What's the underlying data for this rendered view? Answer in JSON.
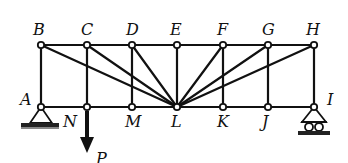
{
  "diagram": {
    "type": "truss",
    "colors": {
      "line": "#111111",
      "node_fill": "#ffffff",
      "background": "#ffffff"
    },
    "top_nodes": [
      {
        "id": "B",
        "label": "B",
        "x": 41,
        "y": 45
      },
      {
        "id": "C",
        "label": "C",
        "x": 87,
        "y": 45
      },
      {
        "id": "D",
        "label": "D",
        "x": 132,
        "y": 45
      },
      {
        "id": "E",
        "label": "E",
        "x": 177,
        "y": 45
      },
      {
        "id": "F",
        "label": "F",
        "x": 223,
        "y": 45
      },
      {
        "id": "G",
        "label": "G",
        "x": 268,
        "y": 45
      },
      {
        "id": "H",
        "label": "H",
        "x": 314,
        "y": 45
      }
    ],
    "bottom_nodes": [
      {
        "id": "A",
        "label": "A",
        "x": 41,
        "y": 107
      },
      {
        "id": "N",
        "label": "N",
        "x": 87,
        "y": 107
      },
      {
        "id": "M",
        "label": "M",
        "x": 132,
        "y": 107
      },
      {
        "id": "L",
        "label": "L",
        "x": 177,
        "y": 107
      },
      {
        "id": "K",
        "label": "K",
        "x": 223,
        "y": 107
      },
      {
        "id": "J",
        "label": "J",
        "x": 268,
        "y": 107
      },
      {
        "id": "I",
        "label": "I",
        "x": 314,
        "y": 107
      }
    ],
    "diagonals": [
      "B-L",
      "C-L",
      "D-L",
      "F-L",
      "G-L",
      "H-L"
    ],
    "verticals": [
      "B-A",
      "C-N",
      "D-M",
      "E-L",
      "F-K",
      "G-J",
      "H-I"
    ],
    "supports": [
      {
        "node": "A",
        "type": "pin"
      },
      {
        "node": "I",
        "type": "roller"
      }
    ],
    "load": {
      "node": "N",
      "label": "P",
      "direction": "down"
    }
  }
}
